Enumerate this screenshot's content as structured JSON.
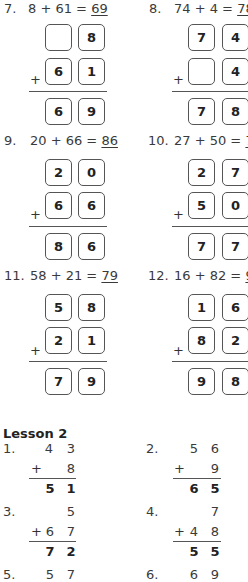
{
  "box_problems": [
    {
      "number": "7.",
      "lhs": "8 + 61 = ",
      "answer": "69",
      "rows": [
        [
          "",
          "8"
        ],
        [
          "6",
          "1"
        ]
      ],
      "result": [
        "6",
        "9"
      ]
    },
    {
      "number": "8.",
      "lhs": "74 + 4 = ",
      "answer": "78",
      "rows": [
        [
          "7",
          "4"
        ],
        [
          "",
          "4"
        ]
      ],
      "result": [
        "7",
        "8"
      ]
    },
    {
      "number": "9.",
      "lhs": "20 + 66 = ",
      "answer": "86",
      "rows": [
        [
          "2",
          "0"
        ],
        [
          "6",
          "6"
        ]
      ],
      "result": [
        "8",
        "6"
      ]
    },
    {
      "number": "10.",
      "lhs": "27 + 50 = ",
      "answer": "77",
      "rows": [
        [
          "2",
          "7"
        ],
        [
          "5",
          "0"
        ]
      ],
      "result": [
        "7",
        "7"
      ]
    },
    {
      "number": "11.",
      "lhs": "58 + 21 = ",
      "answer": "79",
      "rows": [
        [
          "5",
          "8"
        ],
        [
          "2",
          "1"
        ]
      ],
      "result": [
        "7",
        "9"
      ]
    },
    {
      "number": "12.",
      "lhs": "16 + 82 = ",
      "answer": "98",
      "rows": [
        [
          "1",
          "6"
        ],
        [
          "8",
          "2"
        ]
      ],
      "result": [
        "9",
        "8"
      ]
    }
  ],
  "plus_sign": "+",
  "lesson": {
    "title": "Lesson 2",
    "problems": [
      {
        "number": "1.",
        "top": [
          "4",
          "3"
        ],
        "bottom": [
          "",
          "8"
        ],
        "result": [
          "5",
          "1"
        ]
      },
      {
        "number": "2.",
        "top": [
          "5",
          "6"
        ],
        "bottom": [
          "",
          "9"
        ],
        "result": [
          "6",
          "5"
        ]
      },
      {
        "number": "3.",
        "top": [
          "",
          "5"
        ],
        "bottom": [
          "6",
          "7"
        ],
        "result": [
          "7",
          "2"
        ]
      },
      {
        "number": "4.",
        "top": [
          "",
          "7"
        ],
        "bottom": [
          "4",
          "8"
        ],
        "result": [
          "5",
          "5"
        ]
      },
      {
        "number": "5.",
        "top": [
          "5",
          "7"
        ]
      },
      {
        "number": "6.",
        "top": [
          "6",
          "9"
        ]
      }
    ]
  }
}
